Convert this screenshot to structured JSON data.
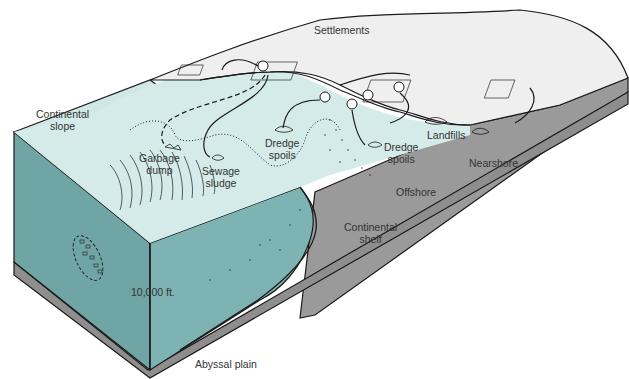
{
  "diagram": {
    "colors": {
      "land_surface": "#efefef",
      "shallow_water": "#cfe7e6",
      "deep_water": "#7fb5b5",
      "water_cross_section": "#76acab",
      "rock_cross_section": "#9a9a9a",
      "outline": "#1a1a1a",
      "label_text": "#333333"
    },
    "labels": {
      "settlements": "Settlements",
      "continental_slope": [
        "Continental",
        "slope"
      ],
      "garbage_dump": [
        "Garbage",
        "dump"
      ],
      "sewage_sludge": [
        "Sewage",
        "sludge"
      ],
      "dredge_spoils_1": [
        "Dredge",
        "spoils"
      ],
      "dredge_spoils_2": [
        "Dredge",
        "spoils"
      ],
      "landfills": "Landfills",
      "nearshore": "Nearshore",
      "offshore": "Offshore",
      "continental_shelf": [
        "Continental",
        "shelf"
      ],
      "depth": "10,000 ft.",
      "abyssal_plain": "Abyssal plain"
    }
  }
}
